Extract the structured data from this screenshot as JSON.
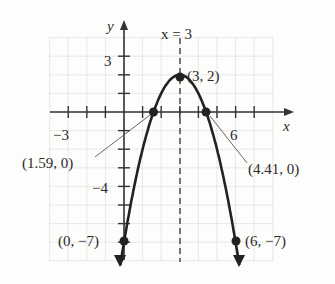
{
  "chart_data": {
    "type": "line",
    "title": "",
    "xlabel": "x",
    "ylabel": "y",
    "xlim": [
      -4,
      8
    ],
    "ylim": [
      -8,
      4
    ],
    "grid": true,
    "function": "y = -(x-3)^2 + 2",
    "axis_of_symmetry": {
      "label": "x = 3",
      "x": 3,
      "style": "dashed"
    },
    "x_tick_labels": [
      {
        "value": -3,
        "label": "−3"
      },
      {
        "value": 6,
        "label": "6"
      }
    ],
    "y_tick_labels": [
      {
        "value": 3,
        "label": "3"
      },
      {
        "value": -4,
        "label": "−4"
      }
    ],
    "points": [
      {
        "x": 3,
        "y": 2,
        "label": "(3, 2)"
      },
      {
        "x": 1.59,
        "y": 0,
        "label": "(1.59, 0)"
      },
      {
        "x": 4.41,
        "y": 0,
        "label": "(4.41, 0)"
      },
      {
        "x": 0,
        "y": -7,
        "label": "(0, −7)"
      },
      {
        "x": 6,
        "y": -7,
        "label": "(6, −7)"
      }
    ]
  },
  "labels": {
    "x_axis": "x",
    "y_axis": "y",
    "symmetry": "x = 3",
    "tick_neg3": "−3",
    "tick_6": "6",
    "tick_3": "3",
    "tick_neg4": "−4",
    "vertex": "(3, 2)",
    "root_left": "(1.59, 0)",
    "root_right": "(4.41, 0)",
    "y_intercept": "(0, −7)",
    "point_6": "(6, −7)"
  }
}
